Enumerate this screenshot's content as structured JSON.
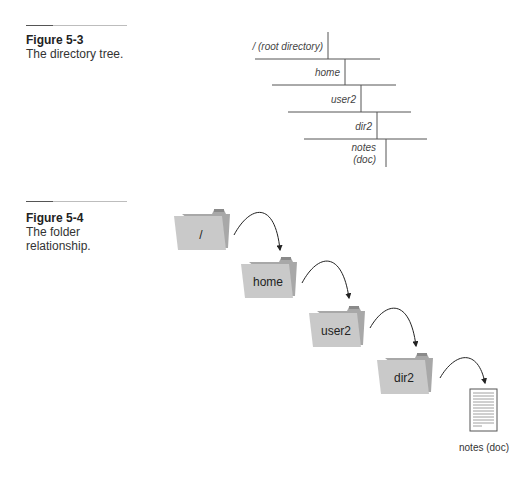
{
  "figures": [
    {
      "number": "Figure 5-3",
      "caption": "The directory tree.",
      "tree": [
        {
          "label": "/ (root directory)"
        },
        {
          "label": "home"
        },
        {
          "label": "user2"
        },
        {
          "label": "dir2"
        },
        {
          "label_line1": "notes",
          "label_line2": "(doc)"
        }
      ]
    },
    {
      "number": "Figure 5-4",
      "caption_line1": "The folder",
      "caption_line2": "relationship.",
      "folders": [
        {
          "label": "/"
        },
        {
          "label": "home"
        },
        {
          "label": "user2"
        },
        {
          "label": "dir2"
        }
      ],
      "document": {
        "label": "notes (doc)",
        "icon": "document-icon"
      }
    }
  ],
  "colors": {
    "folder_front": "#c9c9c9",
    "folder_back": "#a9a9a9",
    "line": "#555555"
  }
}
